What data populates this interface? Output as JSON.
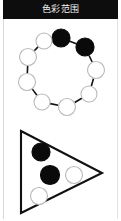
{
  "header": {
    "title": "色彩范围",
    "background_color": "#0d0d0d",
    "text_color": "#f2f2f2"
  },
  "page": {
    "background_color": "#ffffff",
    "border_color": "#d8d8d8",
    "width": 121,
    "height": 221
  },
  "palette": {
    "filled_node_color": "#0a0a0a",
    "open_node_fill": "#ffffff",
    "open_node_stroke": "#b9b9b9",
    "edge_color": "#111111",
    "outline_color": "#111111"
  },
  "figures": {
    "cycle": {
      "name": "cycle-graph",
      "node_count": 9,
      "filled_count": 2,
      "open_count": 7,
      "nodes": [
        {
          "id": "n1",
          "cx": 53,
          "cy": 13,
          "r": 9.0,
          "state": "filled"
        },
        {
          "id": "n2",
          "cx": 77,
          "cy": 22,
          "r": 9.0,
          "state": "filled"
        },
        {
          "id": "n3",
          "cx": 88,
          "cy": 45,
          "r": 8.5,
          "state": "open"
        },
        {
          "id": "n4",
          "cx": 81,
          "cy": 69,
          "r": 8.0,
          "state": "open"
        },
        {
          "id": "n5",
          "cx": 59,
          "cy": 82,
          "r": 8.5,
          "state": "open"
        },
        {
          "id": "n6",
          "cx": 34,
          "cy": 77,
          "r": 8.0,
          "state": "open"
        },
        {
          "id": "n7",
          "cx": 19,
          "cy": 57,
          "r": 8.5,
          "state": "open"
        },
        {
          "id": "n8",
          "cx": 20,
          "cy": 32,
          "r": 8.5,
          "state": "open"
        },
        {
          "id": "n9",
          "cx": 36,
          "cy": 16,
          "r": 8.0,
          "state": "open"
        }
      ],
      "edges": [
        [
          "n1",
          "n2"
        ],
        [
          "n2",
          "n3"
        ],
        [
          "n3",
          "n4"
        ],
        [
          "n4",
          "n5"
        ],
        [
          "n5",
          "n6"
        ],
        [
          "n6",
          "n7"
        ],
        [
          "n7",
          "n8"
        ],
        [
          "n8",
          "n9"
        ],
        [
          "n9",
          "n1"
        ]
      ]
    },
    "triangle": {
      "name": "triangle-region",
      "vertices": [
        [
          13,
          6
        ],
        [
          94,
          48
        ],
        [
          13,
          88
        ]
      ],
      "node_count": 4,
      "filled_count": 2,
      "open_count": 2,
      "nodes": [
        {
          "id": "t1",
          "cx": 33,
          "cy": 27,
          "r": 9.0,
          "state": "filled"
        },
        {
          "id": "t2",
          "cx": 42,
          "cy": 50,
          "r": 9.5,
          "state": "filled"
        },
        {
          "id": "t3",
          "cx": 66,
          "cy": 50,
          "r": 8.5,
          "state": "open"
        },
        {
          "id": "t4",
          "cx": 31,
          "cy": 71,
          "r": 8.5,
          "state": "open"
        }
      ]
    }
  }
}
